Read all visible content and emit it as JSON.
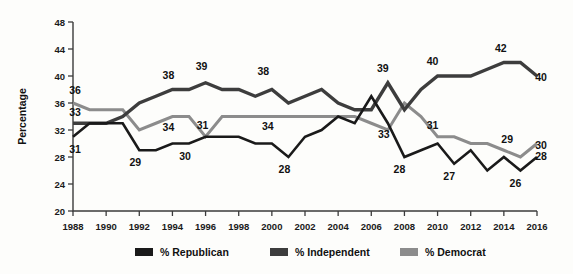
{
  "chart_data": {
    "type": "line",
    "title": "",
    "xlabel": "",
    "ylabel": "Percentage",
    "ylim": [
      20,
      48
    ],
    "ytick_step": 4,
    "yticks": [
      20,
      24,
      28,
      32,
      36,
      40,
      44,
      48
    ],
    "xlim": [
      1988,
      2016
    ],
    "xticks": [
      1988,
      1990,
      1992,
      1994,
      1996,
      1998,
      2000,
      2002,
      2004,
      2006,
      2008,
      2010,
      2012,
      2014,
      2016
    ],
    "x": [
      1988,
      1989,
      1990,
      1991,
      1992,
      1993,
      1994,
      1995,
      1996,
      1997,
      1998,
      1999,
      2000,
      2001,
      2002,
      2003,
      2004,
      2005,
      2006,
      2007,
      2008,
      2009,
      2010,
      2011,
      2012,
      2013,
      2014,
      2015,
      2016
    ],
    "grid": false,
    "legend_position": "bottom",
    "series": [
      {
        "name": "% Republican",
        "color": "#1a1a1a",
        "width": 2.6,
        "values": [
          31,
          33,
          33,
          33,
          29,
          29,
          30,
          30,
          31,
          31,
          31,
          30,
          30,
          28,
          31,
          32,
          34,
          33,
          37,
          33,
          28,
          29,
          30,
          27,
          29,
          26,
          28,
          26,
          28
        ]
      },
      {
        "name": "% Independent",
        "color": "#3d3d3d",
        "width": 3.4,
        "values": [
          33,
          33,
          33,
          34,
          36,
          37,
          38,
          38,
          39,
          38,
          38,
          37,
          38,
          36,
          37,
          38,
          36,
          35,
          35,
          39,
          35,
          38,
          40,
          40,
          40,
          41,
          42,
          42,
          40
        ]
      },
      {
        "name": "% Democrat",
        "color": "#8c8c8c",
        "width": 3.0,
        "values": [
          36,
          35,
          35,
          35,
          32,
          33,
          34,
          34,
          31,
          34,
          34,
          34,
          34,
          34,
          34,
          34,
          34,
          34,
          33,
          32,
          36,
          34,
          31,
          31,
          30,
          30,
          29,
          28,
          30
        ]
      }
    ],
    "annotations": [
      {
        "text": "36",
        "x": 1988,
        "value": 36,
        "dx": 2,
        "dy": -9,
        "series": "% Democrat"
      },
      {
        "text": "33",
        "x": 1988,
        "value": 33,
        "dx": 2,
        "dy": -7,
        "series": "% Independent"
      },
      {
        "text": "31",
        "x": 1988,
        "value": 31,
        "dx": 2,
        "dy": 16,
        "series": "% Republican"
      },
      {
        "text": "38",
        "x": 1994,
        "value": 38,
        "dx": -4,
        "dy": -11,
        "series": "% Independent"
      },
      {
        "text": "39",
        "x": 1996,
        "value": 39,
        "dx": -4,
        "dy": -13,
        "series": "% Independent"
      },
      {
        "text": "38",
        "x": 1999.6,
        "value": 38,
        "dx": -2,
        "dy": -15,
        "series": "% Independent"
      },
      {
        "text": "34",
        "x": 1994,
        "value": 34,
        "dx": -4,
        "dy": 14,
        "series": "% Democrat"
      },
      {
        "text": "31",
        "x": 1996,
        "value": 31,
        "dx": -3,
        "dy": -8,
        "series": "% Democrat"
      },
      {
        "text": "34",
        "x": 2000,
        "value": 34,
        "dx": -4,
        "dy": 13,
        "series": "% Democrat"
      },
      {
        "text": "29",
        "x": 1992,
        "value": 29,
        "dx": -4,
        "dy": 16,
        "series": "% Republican"
      },
      {
        "text": "30",
        "x": 1995,
        "value": 30,
        "dx": -4,
        "dy": 16,
        "series": "% Republican"
      },
      {
        "text": "28",
        "x": 2001,
        "value": 28,
        "dx": -4,
        "dy": 16,
        "series": "% Republican"
      },
      {
        "text": "39",
        "x": 2007,
        "value": 39,
        "dx": -5,
        "dy": -11,
        "series": "% Independent"
      },
      {
        "text": "40",
        "x": 2010,
        "value": 40,
        "dx": -5,
        "dy": -11,
        "series": "% Independent"
      },
      {
        "text": "42",
        "x": 2014,
        "value": 42,
        "dx": -3,
        "dy": -11,
        "series": "% Independent"
      },
      {
        "text": "40",
        "x": 2016,
        "value": 40,
        "dx": 4,
        "dy": 5,
        "series": "% Independent"
      },
      {
        "text": "33",
        "x": 2007,
        "value": 33,
        "dx": -4,
        "dy": 15,
        "series": "% Republican"
      },
      {
        "text": "28",
        "x": 2008,
        "value": 28,
        "dx": -5,
        "dy": 16,
        "series": "% Republican"
      },
      {
        "text": "27",
        "x": 2011,
        "value": 27,
        "dx": -5,
        "dy": 16,
        "series": "% Republican"
      },
      {
        "text": "26",
        "x": 2015,
        "value": 26,
        "dx": -5,
        "dy": 16,
        "series": "% Republican"
      },
      {
        "text": "28",
        "x": 2016,
        "value": 28,
        "dx": 4,
        "dy": 3,
        "series": "% Republican"
      },
      {
        "text": "31",
        "x": 2010,
        "value": 31,
        "dx": -5,
        "dy": -8,
        "series": "% Democrat"
      },
      {
        "text": "29",
        "x": 2014.5,
        "value": 29,
        "dx": -5,
        "dy": -7,
        "series": "% Democrat"
      },
      {
        "text": "30",
        "x": 2016,
        "value": 30,
        "dx": 4,
        "dy": 5,
        "series": "% Democrat"
      }
    ]
  },
  "legend": {
    "items": [
      {
        "label": "% Republican",
        "color": "#1a1a1a"
      },
      {
        "label": "% Independent",
        "color": "#3d3d3d"
      },
      {
        "label": "% Democrat",
        "color": "#8c8c8c"
      }
    ]
  }
}
